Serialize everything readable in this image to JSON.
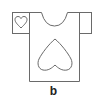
{
  "figure": {
    "label": "b",
    "line_color": "#6a6a6a"
  }
}
